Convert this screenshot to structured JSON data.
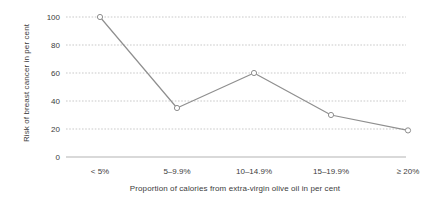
{
  "chart_data": {
    "type": "line",
    "title": "",
    "subtitle": "",
    "xlabel": "Proportion of calories from extra-virgin olive oil in per cent",
    "ylabel": "Risk of breast cancer in per cent",
    "categories": [
      "< 5%",
      "5–9.9%",
      "10–14.9%",
      "15–19.9%",
      "≥ 20%"
    ],
    "values": [
      100,
      35,
      60,
      30,
      19
    ],
    "yticks": [
      "0",
      "20",
      "40",
      "60",
      "80",
      "100"
    ],
    "ytick_values": [
      0,
      20,
      40,
      60,
      80,
      100
    ],
    "ylim": [
      0,
      100
    ],
    "grid": "horizontal-dotted",
    "legend": "none",
    "series": [
      {
        "name": "Risk of breast cancer",
        "values": [
          100,
          35,
          60,
          30,
          19
        ],
        "marker": "open-circle",
        "color": "#8f8f8f"
      }
    ],
    "colors": {
      "line": "#8f8f8f",
      "marker_stroke": "#8f8f8f",
      "marker_fill": "#ffffff",
      "gridline": "#c9c9c9",
      "baseline": "#b4b4b4",
      "text": "#3c3c3c",
      "background": "#ffffff"
    }
  }
}
